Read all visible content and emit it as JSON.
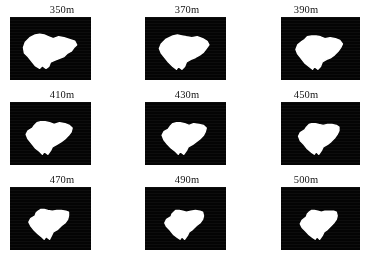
{
  "figure": {
    "title": "",
    "caption": "",
    "background_color": "#ffffff",
    "panel_fill_color": "#040404",
    "shape_color": "#ffffff",
    "label_color": "#141414",
    "rows": 3,
    "columns": 3
  },
  "chart_data": {
    "type": "heatmap",
    "title": "",
    "subtitle": "",
    "xlabel": "",
    "ylabel": "",
    "grid": false,
    "legend_position": "none",
    "series_label": "elevation threshold",
    "units": "m",
    "categories": [
      "350m",
      "370m",
      "390m",
      "410m",
      "430m",
      "450m",
      "470m",
      "490m",
      "500m"
    ],
    "values": [
      350,
      370,
      390,
      410,
      430,
      450,
      470,
      490,
      500
    ],
    "relative_white_area": [
      1.0,
      0.93,
      0.88,
      0.8,
      0.75,
      0.7,
      0.64,
      0.6,
      0.57
    ]
  },
  "panels": [
    {
      "index": 0,
      "label": "350m",
      "value": 350,
      "name": "panel-350m",
      "frame": {
        "left": 10,
        "top": 16,
        "width": 81,
        "height": 63
      },
      "shape_path": "M 22 23 L 17 28 L 15 34 L 16 40 L 20 44 L 24 49 L 28 54 L 33 57 L 36 54 L 40 57 L 43 55 L 45 50 L 50 48 L 55 46 L 60 44 L 64 40 L 68 38 L 71 34 L 74 31 L 72 27 L 66 25 L 60 23 L 54 22 L 48 24 L 43 22 L 38 20 L 33 19 L 28 20 Z"
    },
    {
      "index": 1,
      "label": "370m",
      "value": 370,
      "name": "panel-370m",
      "frame": {
        "left": 145,
        "top": 16,
        "width": 81,
        "height": 63
      },
      "shape_path": "M 23 25 L 18 30 L 16 35 L 18 40 L 22 45 L 26 50 L 31 55 L 35 58 L 37 55 L 41 58 L 44 55 L 46 50 L 51 47 L 56 45 L 61 42 L 65 39 L 68 35 L 71 31 L 69 27 L 64 24 L 58 22 L 52 23 L 46 22 L 41 21 L 36 20 L 31 21 L 27 23 Z"
    },
    {
      "index": 2,
      "label": "390m",
      "value": 390,
      "name": "panel-390m",
      "frame": {
        "left": 281,
        "top": 16,
        "width": 79,
        "height": 63
      },
      "shape_path": "M 24 27 L 19 31 L 17 36 L 19 41 L 23 46 L 27 51 L 32 55 L 36 58 L 38 55 L 42 58 L 45 55 L 47 50 L 52 47 L 57 45 L 61 42 L 65 38 L 68 34 L 70 30 L 67 26 L 62 24 L 56 23 L 50 24 L 45 22 L 40 21 L 35 21 L 30 22 L 27 25 Z"
    },
    {
      "index": 3,
      "label": "410m",
      "value": 410,
      "name": "panel-410m",
      "frame": {
        "left": 10,
        "top": 101,
        "width": 81,
        "height": 63
      },
      "shape_path": "M 25 29 L 20 32 L 18 36 L 20 41 L 24 46 L 28 51 L 33 55 L 36 58 L 38 55 L 42 58 L 45 54 L 47 50 L 52 47 L 57 44 L 61 41 L 65 37 L 68 33 L 69 29 L 66 26 L 61 24 L 55 23 L 49 25 L 44 23 L 39 22 L 34 22 L 30 23 L 27 26 Z"
    },
    {
      "index": 4,
      "label": "430m",
      "value": 430,
      "name": "panel-430m",
      "frame": {
        "left": 145,
        "top": 101,
        "width": 81,
        "height": 63
      },
      "shape_path": "M 26 30 L 21 33 L 19 37 L 21 42 L 25 47 L 29 51 L 34 55 L 37 58 L 39 55 L 43 58 L 46 54 L 48 50 L 53 47 L 57 44 L 61 41 L 65 37 L 67 33 L 68 29 L 65 26 L 60 25 L 54 24 L 49 26 L 44 24 L 39 23 L 35 23 L 31 24 L 28 27 Z"
    },
    {
      "index": 5,
      "label": "450m",
      "value": 450,
      "name": "panel-450m",
      "frame": {
        "left": 281,
        "top": 101,
        "width": 79,
        "height": 63
      },
      "shape_path": "M 27 31 L 22 34 L 20 38 L 22 43 L 26 47 L 30 52 L 35 56 L 38 58 L 40 55 L 43 58 L 46 54 L 48 50 L 53 47 L 57 44 L 61 40 L 64 36 L 66 32 L 66 28 L 63 26 L 58 25 L 53 25 L 48 26 L 43 25 L 39 24 L 35 24 L 32 25 L 29 28 Z"
    },
    {
      "index": 6,
      "label": "470m",
      "value": 470,
      "name": "panel-470m",
      "frame": {
        "left": 10,
        "top": 186,
        "width": 81,
        "height": 63
      },
      "shape_path": "M 28 32 L 23 35 L 21 39 L 23 43 L 27 48 L 31 52 L 36 56 L 38 58 L 40 55 L 44 58 L 46 54 L 48 50 L 53 47 L 57 43 L 61 40 L 64 36 L 65 32 L 65 28 L 62 27 L 57 26 L 52 26 L 47 27 L 42 26 L 38 25 L 34 25 L 31 27 L 29 29 Z"
    },
    {
      "index": 7,
      "label": "490m",
      "value": 490,
      "name": "panel-490m",
      "frame": {
        "left": 145,
        "top": 186,
        "width": 81,
        "height": 63
      },
      "shape_path": "M 29 33 L 24 36 L 22 40 L 24 44 L 28 48 L 32 53 L 36 56 L 39 58 L 41 55 L 44 58 L 47 54 L 49 50 L 53 47 L 57 43 L 61 40 L 64 36 L 65 32 L 64 28 L 61 27 L 56 26 L 51 27 L 46 28 L 42 27 L 38 26 L 34 26 L 32 28 L 30 30 Z"
    },
    {
      "index": 8,
      "label": "500m",
      "value": 500,
      "name": "panel-500m",
      "frame": {
        "left": 281,
        "top": 186,
        "width": 79,
        "height": 63
      },
      "shape_path": "M 29 33 L 24 37 L 22 41 L 24 45 L 28 49 L 32 53 L 36 56 L 39 58 L 41 55 L 44 58 L 47 54 L 49 50 L 53 47 L 57 43 L 60 40 L 63 36 L 64 32 L 63 28 L 60 27 L 55 27 L 50 27 L 46 28 L 42 27 L 38 26 L 35 26 L 32 28 L 30 30 Z"
    }
  ]
}
